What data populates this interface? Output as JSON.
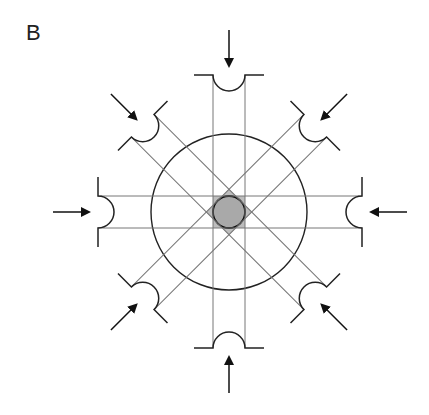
{
  "panel": {
    "label": "B"
  },
  "diagram": {
    "center": [
      229,
      212
    ],
    "outer_circle_radius": 78,
    "inner_circle_radius": 16,
    "band_half_width": 16,
    "colors": {
      "stroke": "#222222",
      "band_line": "#777777",
      "inner_fill": "#a9a9a9",
      "diamond_fill": "#bdbdbd",
      "background": "#ffffff"
    },
    "jaws": [
      {
        "direction": "top",
        "angle": 0,
        "distance": 137
      },
      {
        "direction": "top-right",
        "angle": 45,
        "distance": 122
      },
      {
        "direction": "right",
        "angle": 90,
        "distance": 133
      },
      {
        "direction": "bottom-right",
        "angle": 135,
        "distance": 122
      },
      {
        "direction": "bottom",
        "angle": 180,
        "distance": 136
      },
      {
        "direction": "bottom-left",
        "angle": 225,
        "distance": 122
      },
      {
        "direction": "left",
        "angle": 270,
        "distance": 131
      },
      {
        "direction": "top-left",
        "angle": 315,
        "distance": 122
      }
    ]
  }
}
